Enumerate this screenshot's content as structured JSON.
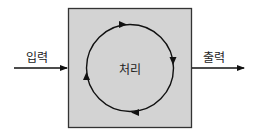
{
  "diagram": {
    "input_label": "입력",
    "output_label": "출력",
    "process_label": "처리",
    "colors": {
      "box_fill": "#d3d3d3",
      "box_border": "#333333",
      "line": "#111111",
      "background": "#ffffff"
    }
  }
}
